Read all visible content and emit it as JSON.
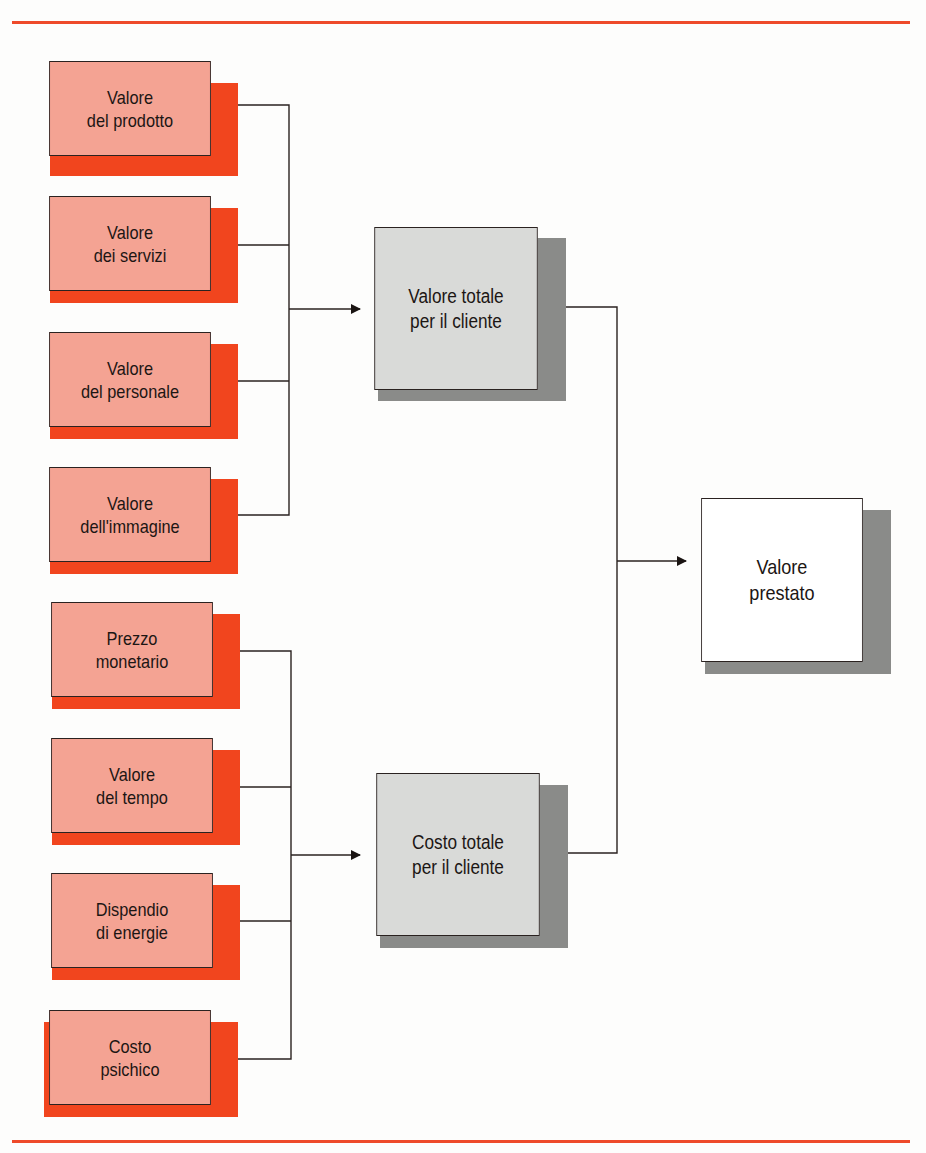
{
  "diagram": {
    "type": "flow",
    "colors": {
      "rule": "#ee4a2a",
      "source_fill": "#f4a393",
      "source_shadow": "#f1451e",
      "total_fill": "#d9dad8",
      "total_shadow": "#8a8b89",
      "result_fill": "#ffffff",
      "line": "#2a2220"
    },
    "value_group": {
      "sources": [
        {
          "id": "valore-prodotto",
          "label": "Valore\ndel prodotto"
        },
        {
          "id": "valore-servizi",
          "label": "Valore\ndei servizi"
        },
        {
          "id": "valore-personale",
          "label": "Valore\ndel personale"
        },
        {
          "id": "valore-immagine",
          "label": "Valore\ndell'immagine"
        }
      ],
      "target": {
        "id": "valore-totale",
        "label": "Valore  totale\nper il cliente"
      }
    },
    "cost_group": {
      "sources": [
        {
          "id": "prezzo-monetario",
          "label": "Prezzo\nmonetario"
        },
        {
          "id": "valore-tempo",
          "label": "Valore\ndel tempo"
        },
        {
          "id": "dispendio-energie",
          "label": "Dispendio\ndi energie"
        },
        {
          "id": "costo-psichico",
          "label": "Costo\npsichico"
        }
      ],
      "target": {
        "id": "costo-totale",
        "label": "Costo totale\nper il cliente"
      }
    },
    "result": {
      "id": "valore-prestato",
      "label": "Valore\nprestato"
    },
    "edges": [
      {
        "from": "valore-prodotto",
        "to": "valore-totale"
      },
      {
        "from": "valore-servizi",
        "to": "valore-totale"
      },
      {
        "from": "valore-personale",
        "to": "valore-totale"
      },
      {
        "from": "valore-immagine",
        "to": "valore-totale"
      },
      {
        "from": "prezzo-monetario",
        "to": "costo-totale"
      },
      {
        "from": "valore-tempo",
        "to": "costo-totale"
      },
      {
        "from": "dispendio-energie",
        "to": "costo-totale"
      },
      {
        "from": "costo-psichico",
        "to": "costo-totale"
      },
      {
        "from": "valore-totale",
        "to": "valore-prestato"
      },
      {
        "from": "costo-totale",
        "to": "valore-prestato"
      }
    ]
  }
}
